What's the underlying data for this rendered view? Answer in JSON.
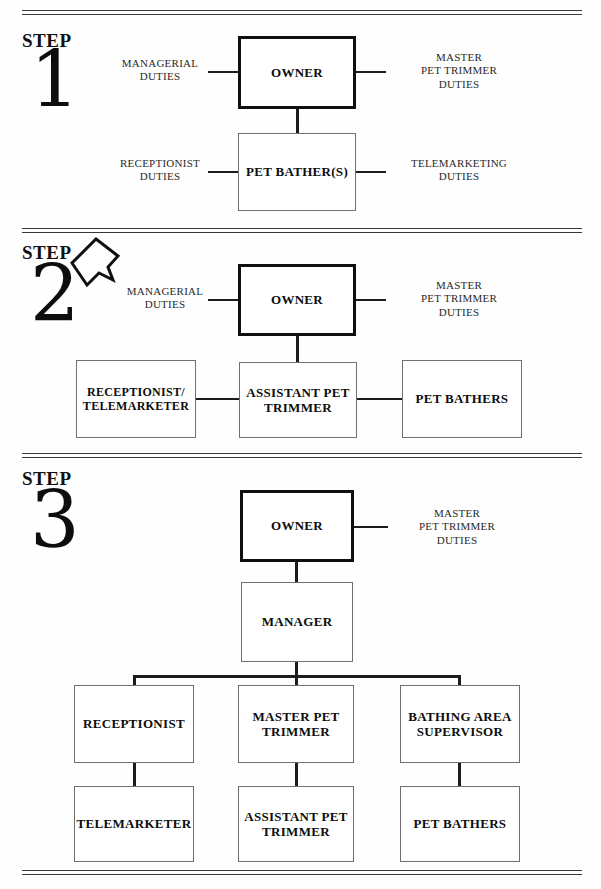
{
  "document": {
    "title": "Pet Grooming Business Organizational Growth Steps",
    "step_word": "STEP"
  },
  "steps": [
    {
      "number": "1",
      "label": "STEP",
      "boxes": [
        {
          "name": "owner",
          "label": "OWNER",
          "emphasis": "thick"
        },
        {
          "name": "pet-bathers",
          "label": "PET\nBATHER(S)",
          "emphasis": "thin"
        }
      ],
      "captions": [
        {
          "name": "managerial-duties",
          "text": "MANAGERIAL\nDUTIES",
          "side": "left",
          "attaches_to": "owner"
        },
        {
          "name": "master-pet-trimmer-duties",
          "text": "MASTER\nPET TRIMMER\nDUTIES",
          "side": "right",
          "attaches_to": "owner"
        },
        {
          "name": "receptionist-duties",
          "text": "RECEPTIONIST\nDUTIES",
          "side": "left",
          "attaches_to": "pet-bathers"
        },
        {
          "name": "telemarketing-duties",
          "text": "TELEMARKETING\nDUTIES",
          "side": "right",
          "attaches_to": "pet-bathers"
        }
      ]
    },
    {
      "number": "2",
      "label": "STEP",
      "boxes": [
        {
          "name": "owner",
          "label": "OWNER",
          "emphasis": "thick"
        },
        {
          "name": "receptionist-telemarketer",
          "label": "RECEPTIONIST/\nTELEMARKETER",
          "emphasis": "thin"
        },
        {
          "name": "assistant-pet-trimmer",
          "label": "ASSISTANT\nPET\nTRIMMER",
          "emphasis": "thin"
        },
        {
          "name": "pet-bathers",
          "label": "PET\nBATHERS",
          "emphasis": "thin"
        }
      ],
      "captions": [
        {
          "name": "managerial-duties",
          "text": "MANAGERIAL\nDUTIES",
          "side": "left",
          "attaches_to": "owner"
        },
        {
          "name": "master-pet-trimmer-duties",
          "text": "MASTER\nPET TRIMMER\nDUTIES",
          "side": "right",
          "attaches_to": "owner"
        }
      ],
      "annotation": {
        "name": "arrow-callout",
        "shape": "hand-drawn-arrow",
        "points_to": "step-number-2"
      }
    },
    {
      "number": "3",
      "label": "STEP",
      "boxes": [
        {
          "name": "owner",
          "label": "OWNER",
          "emphasis": "thick"
        },
        {
          "name": "manager",
          "label": "MANAGER",
          "emphasis": "thin"
        },
        {
          "name": "receptionist",
          "label": "RECEPTIONIST",
          "emphasis": "thin"
        },
        {
          "name": "master-pet-trimmer",
          "label": "MASTER\nPET TRIMMER",
          "emphasis": "thin"
        },
        {
          "name": "bathing-area-supervisor",
          "label": "BATHING AREA\nSUPERVISOR",
          "emphasis": "thin"
        },
        {
          "name": "telemarketer",
          "label": "TELEMARKETER",
          "emphasis": "thin"
        },
        {
          "name": "assistant-pet-trimmer",
          "label": "ASSISTANT\nPET TRIMMER",
          "emphasis": "thin"
        },
        {
          "name": "pet-bathers",
          "label": "PET\nBATHERS",
          "emphasis": "thin"
        }
      ],
      "captions": [
        {
          "name": "master-pet-trimmer-duties",
          "text": "MASTER\nPET TRIMMER\nDUTIES",
          "side": "right",
          "attaches_to": "owner"
        }
      ]
    }
  ],
  "colors": {
    "ink": "#0d0d0d",
    "rule": "#3a3a3a",
    "box_border_thin": "#707070",
    "box_border_thick": "#0f0f0f",
    "connector": "#1c1c1c",
    "paper": "#ffffff"
  }
}
